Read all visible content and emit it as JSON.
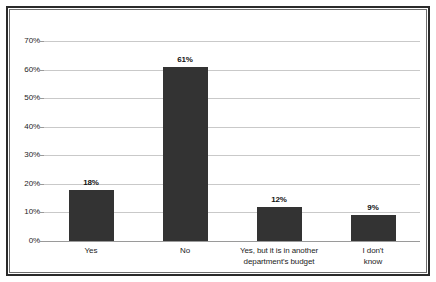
{
  "chart_data": {
    "type": "bar",
    "title": "",
    "subtitle": "",
    "xlabel": "",
    "ylabel": "",
    "categories": [
      "Yes",
      "No",
      "Yes, but it is in another department's budget",
      "I don't know"
    ],
    "category_lines": [
      [
        "Yes"
      ],
      [
        "No"
      ],
      [
        "Yes, but it is in another",
        "department's budget"
      ],
      [
        "I don't",
        "know"
      ]
    ],
    "values": [
      18,
      61,
      12,
      9
    ],
    "data_labels": [
      "18%",
      "61%",
      "12%",
      "9%"
    ],
    "ylim": [
      0,
      70
    ],
    "ytick_values": [
      70,
      60,
      50,
      40,
      30,
      20,
      10,
      0
    ],
    "ytick_labels": [
      "70%",
      "60%",
      "50%",
      "40%",
      "30%",
      "20%",
      "10%",
      "0%"
    ],
    "grid": true,
    "legend": false,
    "legend_position": "none",
    "unit": "%",
    "series": [
      {
        "name": "Responses",
        "values": [
          18,
          61,
          12,
          9
        ],
        "color": "#333333"
      }
    ]
  },
  "colors": {
    "bar": "#333333",
    "gridline": "#c9c9c9",
    "axis": "#9a9a9a",
    "frame_outer": "#2b2b2b",
    "frame_inner": "#6e6e6e",
    "text": "#1d1d1d",
    "background": "#ffffff"
  }
}
